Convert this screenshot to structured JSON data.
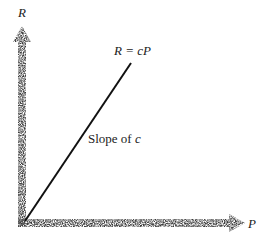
{
  "chart_data": {
    "type": "line",
    "title": "",
    "xlabel": "P",
    "ylabel": "R",
    "series": [
      {
        "name": "R = cP",
        "x": [
          0,
          1
        ],
        "y": [
          0,
          1.49
        ]
      }
    ],
    "annotations": [
      {
        "text": "R = cP",
        "anchor": "line-end"
      },
      {
        "text": "Slope of c",
        "anchor": "line-middle"
      }
    ],
    "grid": false,
    "legend": "none"
  },
  "labels": {
    "y_axis": "R",
    "x_axis": "P",
    "equation": "R = cP",
    "slope_prefix": "Slope of ",
    "slope_var": "c"
  },
  "colors": {
    "axis": "#555555",
    "line": "#111111",
    "text": "#222222"
  }
}
